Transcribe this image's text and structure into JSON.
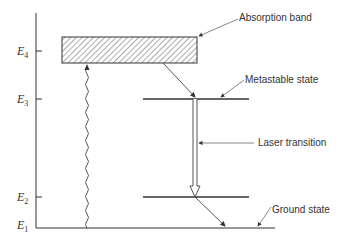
{
  "diagram": {
    "levels": [
      {
        "id": "E4",
        "symbol": "E",
        "subscript": "4"
      },
      {
        "id": "E3",
        "symbol": "E",
        "subscript": "3"
      },
      {
        "id": "E2",
        "symbol": "E",
        "subscript": "2"
      },
      {
        "id": "E1",
        "symbol": "E",
        "subscript": "1"
      }
    ],
    "annotations": {
      "absorption_band": "Absorption band",
      "metastable_state": "Metastable state",
      "laser_transition": "Laser transition",
      "ground_state": "Ground state"
    },
    "colors": {
      "line": "#333333",
      "background": "#ffffff"
    }
  }
}
